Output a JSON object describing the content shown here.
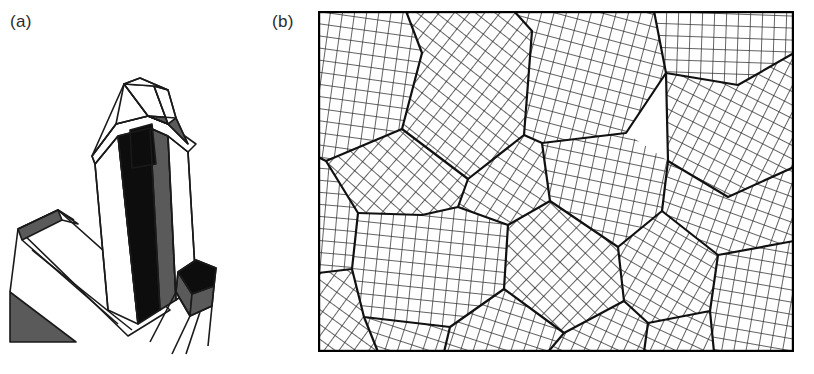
{
  "figure": {
    "type": "scientific-illustration",
    "caption_labels": {
      "panel_a": "(a)",
      "panel_b": "(b)"
    },
    "colors": {
      "background": "#ffffff",
      "ink": "#1a1a1a",
      "face_dark": "#0d0d0d",
      "face_mid_gray": "#5a5a5a",
      "face_light_gray": "#9a9a9a",
      "face_white": "#ffffff",
      "label_text": "#2b2b2b",
      "grain_boundary": "#111111",
      "lattice_line": "#303030",
      "panel_border": "#000000"
    },
    "panel_a": {
      "name": "single-crystal-line-drawing",
      "description": "Line drawing of euhedral prismatic quartz crystals with pyramidal terminations, shown with shaded faces",
      "crystal_count": 3,
      "crystals": [
        {
          "id": "main-crystal",
          "habit": "hexagonal-prism-with-pyramid-termination",
          "faces_shaded": [
            "black",
            "gray",
            "white"
          ]
        },
        {
          "id": "lower-left-crystal",
          "habit": "prism-fragment",
          "faces_shaded": [
            "gray",
            "white"
          ]
        },
        {
          "id": "small-right-crystal",
          "habit": "small-prism",
          "faces_shaded": [
            "black",
            "gray",
            "white"
          ]
        }
      ]
    },
    "panel_b": {
      "name": "polycrystalline-grain-structure",
      "description": "Schematic of a polycrystalline aggregate: many grains, each an identical square lattice rotated to a different orientation, meeting at grain boundaries and triple junctions",
      "border": true,
      "grain_count": 17,
      "lattice_spacing_px": 12,
      "grains": [
        {
          "id": 1,
          "rotation_deg": 8,
          "cx": 60,
          "cy": 50
        },
        {
          "id": 2,
          "rotation_deg": 38,
          "cx": 150,
          "cy": 75
        },
        {
          "id": 3,
          "rotation_deg": 15,
          "cx": 265,
          "cy": 60
        },
        {
          "id": 4,
          "rotation_deg": 2,
          "cx": 365,
          "cy": 45
        },
        {
          "id": 5,
          "rotation_deg": 27,
          "cx": 430,
          "cy": 85
        },
        {
          "id": 6,
          "rotation_deg": 5,
          "cx": 45,
          "cy": 175
        },
        {
          "id": 7,
          "rotation_deg": 41,
          "cx": 140,
          "cy": 175
        },
        {
          "id": 8,
          "rotation_deg": 33,
          "cx": 230,
          "cy": 150
        },
        {
          "id": 9,
          "rotation_deg": 12,
          "cx": 330,
          "cy": 150
        },
        {
          "id": 10,
          "rotation_deg": 20,
          "cx": 430,
          "cy": 175
        },
        {
          "id": 11,
          "rotation_deg": 44,
          "cx": 245,
          "cy": 235
        },
        {
          "id": 12,
          "rotation_deg": 6,
          "cx": 100,
          "cy": 265
        },
        {
          "id": 13,
          "rotation_deg": 30,
          "cx": 360,
          "cy": 245
        },
        {
          "id": 14,
          "rotation_deg": 10,
          "cx": 445,
          "cy": 270
        },
        {
          "id": 15,
          "rotation_deg": 36,
          "cx": 60,
          "cy": 320
        },
        {
          "id": 16,
          "rotation_deg": 18,
          "cx": 180,
          "cy": 315
        },
        {
          "id": 17,
          "rotation_deg": 25,
          "cx": 300,
          "cy": 320
        }
      ]
    }
  }
}
